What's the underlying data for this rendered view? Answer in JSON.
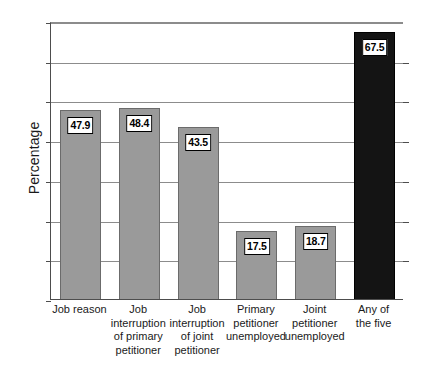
{
  "chart_data": {
    "type": "bar",
    "title": "",
    "xlabel": "",
    "ylabel": "Percentage",
    "ylim": [
      0,
      70
    ],
    "ytick_step": 10,
    "yticks": [
      "0",
      "10",
      "20",
      "30",
      "40",
      "50",
      "60",
      "70"
    ],
    "grid": true,
    "legend": "none",
    "categories": [
      "Job reason",
      "Job interruption of primary petitioner",
      "Job interruption of joint petitioner",
      "Primary petitioner unemployed",
      "Joint petitioner unemployed",
      "Any of the five"
    ],
    "category_lines": [
      [
        "Job reason"
      ],
      [
        "Job",
        "interruption",
        "of primary",
        "petitioner"
      ],
      [
        "Job",
        "interruption",
        "of joint",
        "petitioner"
      ],
      [
        "Primary",
        "petitioner",
        "unemployed"
      ],
      [
        "Joint",
        "petitioner",
        "unemployed"
      ],
      [
        "Any of",
        "the five"
      ]
    ],
    "values": [
      47.9,
      48.4,
      43.5,
      17.5,
      18.7,
      67.5
    ],
    "value_labels": [
      "47.9",
      "48.4",
      "43.5",
      "17.5",
      "18.7",
      "67.5"
    ],
    "bar_colors": [
      "#9a9a9a",
      "#9a9a9a",
      "#9a9a9a",
      "#9a9a9a",
      "#9a9a9a",
      "#141414"
    ],
    "accent_color": "#9a9a9a",
    "highlight_color": "#141414"
  }
}
